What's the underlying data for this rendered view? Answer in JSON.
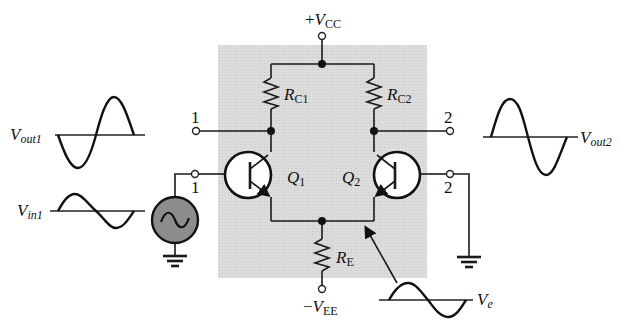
{
  "diagram": {
    "colors": {
      "shade": "#d9d9d9",
      "source_fill": "#8c8c8c",
      "line": "#1a1a1a"
    },
    "supply_top": {
      "sign": "+",
      "V": "V",
      "sub": "CC"
    },
    "supply_bottom": {
      "sign": "−",
      "V": "V",
      "sub": "EE"
    },
    "resistors": [
      {
        "R": "R",
        "sub": "C1"
      },
      {
        "R": "R",
        "sub": "C2"
      },
      {
        "R": "R",
        "sub": "E"
      }
    ],
    "transistors": [
      {
        "Q": "Q",
        "sub": "1"
      },
      {
        "Q": "Q",
        "sub": "2"
      }
    ],
    "terminals": {
      "out1": "1",
      "in1": "1",
      "out2": "2",
      "in2": "2"
    },
    "signals": {
      "vout1": {
        "V": "V",
        "sub": "out1"
      },
      "vin1": {
        "V": "V",
        "sub": "in1"
      },
      "vout2": {
        "V": "V",
        "sub": "out2"
      },
      "ve": {
        "V": "V",
        "sub": "e"
      }
    },
    "source_symbol": "ac-source-icon"
  }
}
